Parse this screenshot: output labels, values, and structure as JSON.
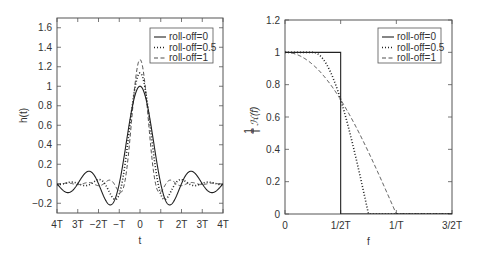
{
  "chart_data": [
    {
      "type": "line",
      "title": "",
      "xlabel": "t",
      "ylabel": "h(t)",
      "xlim": [
        -4,
        4
      ],
      "ylim": [
        -0.3,
        1.7
      ],
      "xticks": [
        -4,
        -3,
        -2,
        -1,
        0,
        1,
        2,
        3,
        4
      ],
      "xticklabels": [
        "4T",
        "3T",
        "−2T",
        "−T",
        "0",
        "T",
        "2T",
        "3T",
        "4T"
      ],
      "yticks": [
        -0.2,
        0,
        0.2,
        0.4,
        0.6,
        0.8,
        1,
        1.2,
        1.4,
        1.6
      ],
      "yticklabels": [
        "−0.2",
        "0",
        "0.2",
        "0.4",
        "0.6",
        "0.8",
        "1",
        "1.2",
        "1.4",
        "1.6"
      ],
      "grid": false,
      "legend_position": "upper right",
      "x": [
        -4,
        -3,
        -2,
        -1.5,
        -1,
        -0.5,
        0,
        0.5,
        1,
        1.5,
        2,
        3,
        4
      ],
      "series": [
        {
          "name": "roll-off=0",
          "rolloff": 0,
          "style": "solid",
          "values": [
            0,
            0,
            0,
            -0.21,
            0,
            0.64,
            1.0,
            0.64,
            0,
            -0.21,
            0,
            0,
            0
          ]
        },
        {
          "name": "roll-off=0.5",
          "rolloff": 0.5,
          "style": "dotted",
          "values": [
            0.02,
            -0.02,
            0.05,
            -0.13,
            -0.11,
            0.6,
            1.14,
            0.6,
            -0.11,
            -0.13,
            0.05,
            -0.02,
            0.02
          ]
        },
        {
          "name": "roll-off=1",
          "rolloff": 1,
          "style": "dashed",
          "values": [
            0,
            0.01,
            -0.02,
            0.05,
            -0.18,
            0.42,
            1.27,
            0.42,
            -0.18,
            0.05,
            -0.02,
            0.01,
            0
          ]
        }
      ]
    },
    {
      "type": "line",
      "title": "",
      "xlabel": "f",
      "ylabel": "(1/T) H(f)",
      "xlim": [
        0,
        1.5
      ],
      "ylim": [
        0,
        1.2
      ],
      "xticks": [
        0,
        0.5,
        1,
        1.5
      ],
      "xticklabels": [
        "0",
        "1/2T",
        "1/T",
        "3/2T"
      ],
      "yticks": [
        0,
        0.2,
        0.4,
        0.6,
        0.8,
        1,
        1.2
      ],
      "yticklabels": [
        "0",
        "0.2",
        "0.4",
        "0.6",
        "0.8",
        "1",
        "1.2"
      ],
      "grid": false,
      "legend_position": "upper right",
      "x": [
        0,
        0.25,
        0.4,
        0.5,
        0.6,
        0.75,
        0.9,
        1.0,
        1.5
      ],
      "series": [
        {
          "name": "roll-off=0",
          "rolloff": 0,
          "style": "solid",
          "values": [
            1,
            1,
            1,
            0.707,
            0,
            0,
            0,
            0,
            0
          ]
        },
        {
          "name": "roll-off=0.5",
          "rolloff": 0.5,
          "style": "dotted",
          "values": [
            1,
            1,
            0.95,
            0.707,
            0.31,
            0,
            0,
            0,
            0
          ]
        },
        {
          "name": "roll-off=1",
          "rolloff": 1,
          "style": "dashed",
          "values": [
            1,
            0.92,
            0.81,
            0.707,
            0.59,
            0.38,
            0.16,
            0,
            0
          ]
        }
      ]
    }
  ],
  "legend_labels": [
    "roll-off=0",
    "roll-off=0.5",
    "roll-off=1"
  ],
  "colors": {
    "line": "#222222",
    "axis": "#555555",
    "text": "#333333"
  }
}
